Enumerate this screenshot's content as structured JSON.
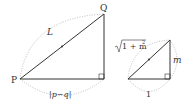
{
  "diagram": {
    "large_triangle": {
      "vertex_left": "P",
      "vertex_top": "Q",
      "hypotenuse_label": "L",
      "base_label": "|p − q|",
      "base_label_parts": {
        "bar_left": "|",
        "p": "p",
        "minus": "−",
        "q": "q",
        "bar_right": "|"
      }
    },
    "small_triangle": {
      "hypotenuse_label_radicand": "1 + m",
      "hypotenuse_label_exp": "2",
      "vertical_label": "m",
      "base_label": "1"
    },
    "colors": {
      "line": "#333333",
      "dotted_arc": "#aaaaaa",
      "text": "#333333"
    }
  }
}
